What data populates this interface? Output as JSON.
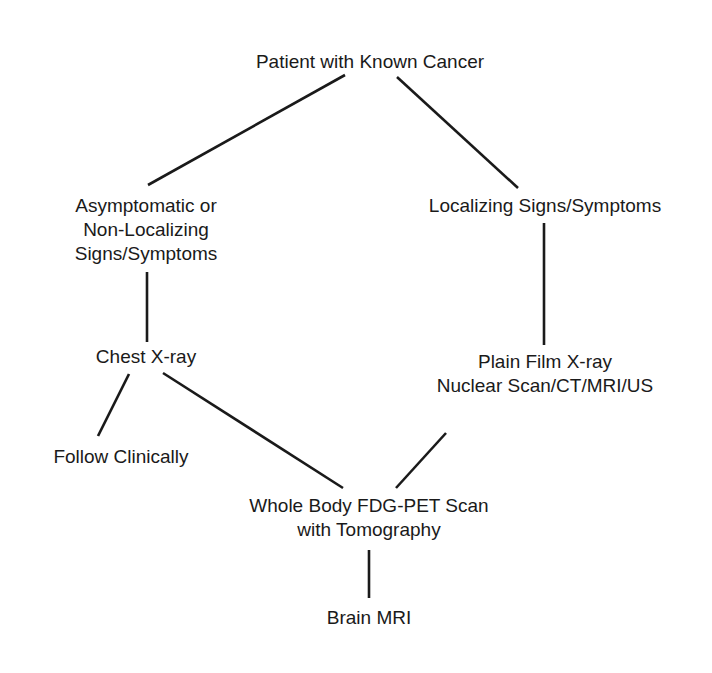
{
  "diagram": {
    "type": "flowchart",
    "nodes": [
      {
        "id": "patient",
        "lines": [
          "Patient with Known Cancer"
        ]
      },
      {
        "id": "asymptomatic",
        "lines": [
          "Asymptomatic or",
          "Non-Localizing",
          "Signs/Symptoms"
        ]
      },
      {
        "id": "localizing",
        "lines": [
          "Localizing Signs/Symptoms"
        ]
      },
      {
        "id": "chest_xray",
        "lines": [
          "Chest X-ray"
        ]
      },
      {
        "id": "plain_film",
        "lines": [
          "Plain Film X-ray",
          "Nuclear Scan/CT/MRI/US"
        ]
      },
      {
        "id": "follow",
        "lines": [
          "Follow Clinically"
        ]
      },
      {
        "id": "pet",
        "lines": [
          "Whole Body FDG-PET Scan",
          "with Tomography"
        ]
      },
      {
        "id": "brain",
        "lines": [
          "Brain MRI"
        ]
      }
    ],
    "edges": [
      {
        "from": "patient",
        "to": "asymptomatic"
      },
      {
        "from": "patient",
        "to": "localizing"
      },
      {
        "from": "asymptomatic",
        "to": "chest_xray"
      },
      {
        "from": "localizing",
        "to": "plain_film"
      },
      {
        "from": "chest_xray",
        "to": "follow"
      },
      {
        "from": "chest_xray",
        "to": "pet"
      },
      {
        "from": "plain_film",
        "to": "pet"
      },
      {
        "from": "pet",
        "to": "brain"
      }
    ]
  }
}
